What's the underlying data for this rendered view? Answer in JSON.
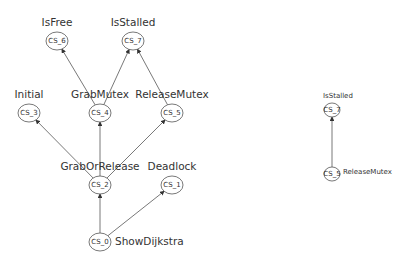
{
  "diagram": {
    "left_graph": {
      "nodes": [
        {
          "id": "CS_6",
          "label": "IsFree",
          "cx": 57,
          "cy": 41
        },
        {
          "id": "CS_7",
          "label": "IsStalled",
          "cx": 133,
          "cy": 41
        },
        {
          "id": "CS_3",
          "label": "Initial",
          "cx": 29,
          "cy": 113
        },
        {
          "id": "CS_4",
          "label": "GrabMutex",
          "cx": 100,
          "cy": 113
        },
        {
          "id": "CS_5",
          "label": "ReleaseMutex",
          "cx": 172,
          "cy": 113
        },
        {
          "id": "CS_2",
          "label": "GrabOrRelease",
          "cx": 100,
          "cy": 185
        },
        {
          "id": "CS_1",
          "label": "Deadlock",
          "cx": 172,
          "cy": 185
        },
        {
          "id": "CS_0",
          "label": "ShowDijkstra",
          "cx": 100,
          "cy": 242
        }
      ],
      "edges": [
        {
          "from": "CS_0",
          "to": "CS_2"
        },
        {
          "from": "CS_0",
          "to": "CS_1"
        },
        {
          "from": "CS_2",
          "to": "CS_3"
        },
        {
          "from": "CS_2",
          "to": "CS_4"
        },
        {
          "from": "CS_2",
          "to": "CS_5"
        },
        {
          "from": "CS_4",
          "to": "CS_6"
        },
        {
          "from": "CS_4",
          "to": "CS_7"
        },
        {
          "from": "CS_5",
          "to": "CS_7"
        }
      ]
    },
    "right_graph": {
      "nodes": [
        {
          "id": "CS_7",
          "label": "IsStalled",
          "cx": 332,
          "cy": 110
        },
        {
          "id": "CS_5",
          "label": "ReleaseMutex",
          "cx": 332,
          "cy": 174
        }
      ],
      "edges": [
        {
          "from": "CS_5",
          "to": "CS_7"
        }
      ]
    },
    "colors": {
      "stroke": "#555555",
      "text": "#333333",
      "background": "#ffffff"
    }
  }
}
